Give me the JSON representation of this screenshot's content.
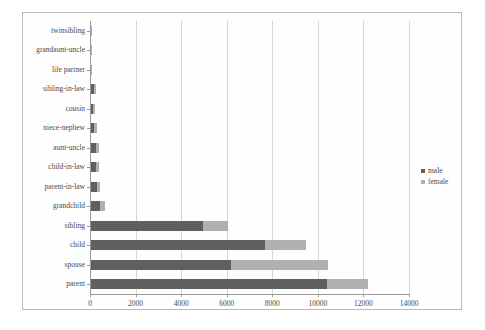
{
  "chart_data": {
    "type": "bar",
    "orientation": "horizontal",
    "stacked": true,
    "title": "",
    "xlabel": "",
    "ylabel": "",
    "xlim": [
      0,
      14000
    ],
    "xticks": [
      0,
      2000,
      4000,
      6000,
      8000,
      10000,
      12000,
      14000
    ],
    "xtick_labels": [
      "0",
      "2000",
      "4000",
      "6000",
      "8000",
      "10000",
      "12000",
      "14000"
    ],
    "grid": true,
    "legend_position": "right",
    "categories": [
      "twinsibling",
      "grandaunt-uncle",
      "life partner",
      "sibling-in-law",
      "cousin",
      "niece-nephew",
      "aunt-uncle",
      "child-in-law",
      "parent-in-law",
      "grandchild",
      "sibling",
      "child",
      "spouse",
      "parent"
    ],
    "series": [
      {
        "name": "male",
        "color": "#5f5f5f",
        "values": [
          40,
          50,
          55,
          170,
          150,
          190,
          250,
          250,
          290,
          430,
          4950,
          7680,
          6200,
          10390
        ]
      },
      {
        "name": "female",
        "color": "#b0b0b0",
        "values": [
          10,
          15,
          20,
          90,
          70,
          110,
          150,
          150,
          150,
          240,
          1120,
          1790,
          4250,
          1830
        ]
      }
    ],
    "totals": [
      50,
      65,
      75,
      260,
      220,
      300,
      400,
      400,
      440,
      670,
      6070,
      9470,
      10450,
      12220
    ]
  },
  "legend": {
    "items": [
      {
        "label": "male"
      },
      {
        "label": "female"
      }
    ]
  }
}
